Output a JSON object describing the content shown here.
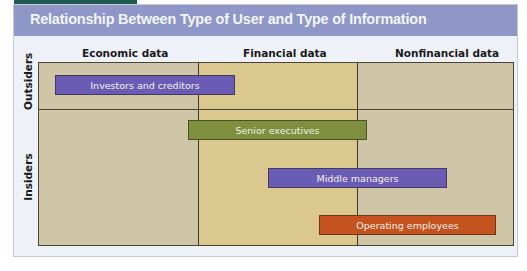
{
  "title": "Relationship Between Type of User and Type of Information",
  "columns": [
    {
      "label": "Economic data"
    },
    {
      "label": "Financial data"
    },
    {
      "label": "Nonfinancial data"
    }
  ],
  "rows": [
    {
      "label": "Outsiders"
    },
    {
      "label": "Insiders"
    }
  ],
  "bars": [
    {
      "label": "Investors and creditors",
      "group": "Outsiders",
      "spans": [
        "Economic data",
        "Financial data"
      ],
      "color": "#6a5cb4"
    },
    {
      "label": "Senior executives",
      "group": "Insiders",
      "spans": [
        "Economic data",
        "Financial data",
        "Nonfinancial data"
      ],
      "color": "#7e8f3e"
    },
    {
      "label": "Middle managers",
      "group": "Insiders",
      "spans": [
        "Financial data",
        "Nonfinancial data"
      ],
      "color": "#6a5cb4"
    },
    {
      "label": "Operating employees",
      "group": "Insiders",
      "spans": [
        "Financial data",
        "Nonfinancial data"
      ],
      "color": "#c4531f"
    }
  ],
  "colors": {
    "title_bar": "#8e97c8",
    "economic_column": "#cec6a6",
    "financial_column": "#dac88f",
    "nonfinancial_column": "#cec6a6",
    "top_tab": "#1f5a52"
  }
}
